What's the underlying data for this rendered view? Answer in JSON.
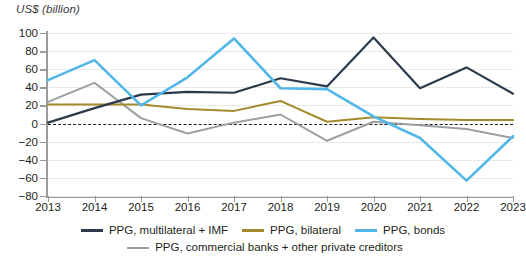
{
  "chart_data": {
    "type": "line",
    "title": "",
    "ylabel": "US$ (billion)",
    "xlabel": "",
    "categories": [
      "2013",
      "2014",
      "2015",
      "2016",
      "2017",
      "2018",
      "2019",
      "2020",
      "2021",
      "2022",
      "2023"
    ],
    "x": [
      2013,
      2014,
      2015,
      2016,
      2017,
      2018,
      2019,
      2020,
      2021,
      2022,
      2023
    ],
    "ylim": [
      -80,
      100
    ],
    "yticks": [
      -80,
      -60,
      -40,
      -20,
      0,
      20,
      40,
      60,
      80,
      100
    ],
    "grid": true,
    "zero_reference_line": true,
    "legend_position": "bottom",
    "series": [
      {
        "name": "PPG, multilateral + IMF",
        "color": "#2b3a4a",
        "values": [
          1,
          17,
          32,
          35,
          34,
          50,
          41,
          95,
          39,
          62,
          33
        ]
      },
      {
        "name": "PPG, bilateral",
        "color": "#a58a2b",
        "values": [
          21,
          21,
          21,
          16,
          14,
          25,
          2,
          7,
          5,
          4,
          4
        ]
      },
      {
        "name": "PPG, bonds",
        "color": "#51b7e8",
        "values": [
          48,
          70,
          20,
          51,
          94,
          39,
          38,
          8,
          -16,
          -63,
          -14
        ]
      },
      {
        "name": "PPG, commercial banks + other private creditors",
        "color": "#9a9fa3",
        "values": [
          24,
          45,
          6,
          -11,
          1,
          10,
          -19,
          2,
          -2,
          -6,
          -16
        ]
      }
    ]
  },
  "legend": {
    "items": [
      {
        "label": "PPG, multilateral + IMF",
        "color": "#2b3a4a"
      },
      {
        "label": "PPG, bilateral",
        "color": "#a58a2b"
      },
      {
        "label": "PPG, bonds",
        "color": "#51b7e8"
      },
      {
        "label": "PPG, commercial banks + other private creditors",
        "color": "#9a9fa3"
      }
    ]
  },
  "axis": {
    "y_title": "US$ (billion)",
    "y_labels": [
      "100",
      "80",
      "60",
      "40",
      "20",
      "0",
      "−20",
      "−40",
      "−60",
      "−80"
    ],
    "x_labels": [
      "2013",
      "2014",
      "2015",
      "2016",
      "2017",
      "2018",
      "2019",
      "2020",
      "2021",
      "2022",
      "2023"
    ]
  }
}
